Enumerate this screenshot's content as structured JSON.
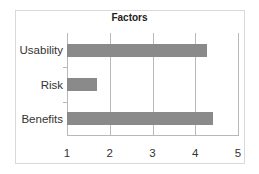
{
  "chart_data": {
    "type": "bar",
    "orientation": "horizontal",
    "title": "Factors",
    "categories": [
      "Usability",
      "Risk",
      "Benefits"
    ],
    "values": [
      4.27,
      1.71,
      4.41
    ],
    "xlabel": "",
    "ylabel": "",
    "xlim": [
      1,
      5
    ],
    "xticks": [
      "1",
      "2",
      "3",
      "4",
      "5"
    ],
    "grid": true,
    "legend": false,
    "bar_color": "#8a8a8a"
  }
}
